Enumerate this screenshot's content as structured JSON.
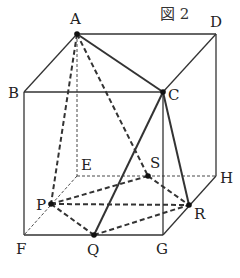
{
  "title": "図 2",
  "colors": {
    "line": "#333333",
    "background": "#ffffff"
  },
  "vertices": {
    "A": {
      "x": 77,
      "y": 34,
      "label": "A",
      "lx": 70,
      "ly": 24
    },
    "D": {
      "x": 216,
      "y": 34,
      "label": "D",
      "lx": 210,
      "ly": 27
    },
    "B": {
      "x": 24,
      "y": 92,
      "label": "B",
      "lx": 8,
      "ly": 98
    },
    "C": {
      "x": 163,
      "y": 92,
      "label": "C",
      "lx": 168,
      "ly": 100
    },
    "E": {
      "x": 77,
      "y": 176,
      "label": "E",
      "lx": 81,
      "ly": 170
    },
    "H": {
      "x": 216,
      "y": 176,
      "label": "H",
      "lx": 220,
      "ly": 183
    },
    "F": {
      "x": 24,
      "y": 235,
      "label": "F",
      "lx": 16,
      "ly": 254
    },
    "G": {
      "x": 163,
      "y": 235,
      "label": "G",
      "lx": 156,
      "ly": 254
    },
    "P": {
      "x": 51,
      "y": 204,
      "label": "P",
      "lx": 36,
      "ly": 210
    },
    "Q": {
      "x": 94,
      "y": 235,
      "label": "Q",
      "lx": 87,
      "ly": 255
    },
    "S": {
      "x": 148,
      "y": 176,
      "label": "S",
      "lx": 150,
      "ly": 168
    },
    "R": {
      "x": 189,
      "y": 205,
      "label": "R",
      "lx": 194,
      "ly": 219
    }
  },
  "segments": [
    {
      "from": "A",
      "to": "D",
      "style": "solid-thin"
    },
    {
      "from": "A",
      "to": "B",
      "style": "solid-thin"
    },
    {
      "from": "D",
      "to": "C",
      "style": "solid-thin"
    },
    {
      "from": "B",
      "to": "C",
      "style": "solid-thin"
    },
    {
      "from": "B",
      "to": "F",
      "style": "solid-thin"
    },
    {
      "from": "C",
      "to": "G",
      "style": "solid-thin"
    },
    {
      "from": "D",
      "to": "H",
      "style": "solid-thin"
    },
    {
      "from": "F",
      "to": "G",
      "style": "solid-thin"
    },
    {
      "from": "G",
      "to": "H",
      "style": "solid-thin"
    },
    {
      "from": "A",
      "to": "E",
      "style": "dashed-thin"
    },
    {
      "from": "E",
      "to": "F",
      "style": "dashed-thin"
    },
    {
      "from": "E",
      "to": "H",
      "style": "dashed-thin"
    },
    {
      "from": "A",
      "to": "C",
      "style": "solid-thick"
    },
    {
      "from": "C",
      "to": "Q",
      "style": "solid-thick"
    },
    {
      "from": "C",
      "to": "R",
      "style": "solid-thick"
    },
    {
      "from": "A",
      "to": "P",
      "style": "dashed-thick"
    },
    {
      "from": "A",
      "to": "S",
      "style": "dashed-thick"
    },
    {
      "from": "P",
      "to": "Q",
      "style": "dashed-thick"
    },
    {
      "from": "P",
      "to": "S",
      "style": "dashed-thick"
    },
    {
      "from": "P",
      "to": "R",
      "style": "dashed-thick"
    },
    {
      "from": "Q",
      "to": "R",
      "style": "dashed-thick"
    },
    {
      "from": "S",
      "to": "R",
      "style": "dashed-thick"
    }
  ],
  "dots": [
    "A",
    "C",
    "P",
    "Q",
    "S",
    "R"
  ]
}
